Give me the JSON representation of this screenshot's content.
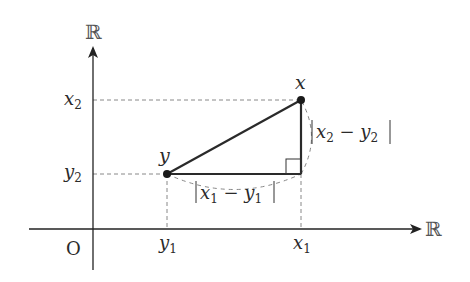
{
  "diagram": {
    "axes": {
      "vertical_label": "ℝ",
      "horizontal_label": "ℝ",
      "origin_label": "O"
    },
    "points": {
      "x": {
        "label": "x",
        "px": [
          301,
          100
        ]
      },
      "y": {
        "label": "y",
        "px": [
          167,
          174
        ]
      }
    },
    "ticks": {
      "x2": {
        "base": "x",
        "sub": "2"
      },
      "y2": {
        "base": "y",
        "sub": "2"
      },
      "y1": {
        "base": "y",
        "sub": "1"
      },
      "x1": {
        "base": "x",
        "sub": "1"
      }
    },
    "side_labels": {
      "horizontal": {
        "text": "|x₁ − y₁|",
        "a": "x",
        "a_sub": "1",
        "b": "y",
        "b_sub": "1"
      },
      "vertical": {
        "text": "|x₂ − y₂|",
        "a": "x",
        "a_sub": "2",
        "b": "y",
        "b_sub": "2"
      }
    },
    "colors": {
      "line": "#2a2a2a",
      "dashed": "#888888",
      "background": "#ffffff"
    }
  }
}
